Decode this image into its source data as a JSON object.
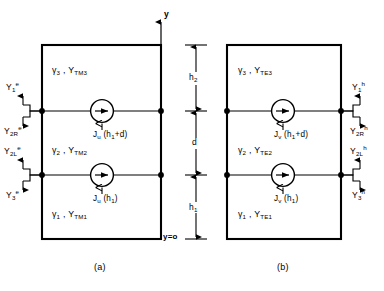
{
  "figure": {
    "background": "#ffffff",
    "line_color": "#000000",
    "panels": [
      {
        "id": "a",
        "caption": "(a)",
        "mode": "TM",
        "media": [
          {
            "region": "top",
            "gamma": "γ",
            "gamma_sub": "3",
            "admittance": "Y",
            "admittance_sub": "TM3"
          },
          {
            "region": "middle",
            "gamma": "γ",
            "gamma_sub": "2",
            "admittance": "Y",
            "admittance_sub": "TM2"
          },
          {
            "region": "bottom",
            "gamma": "γ",
            "gamma_sub": "1",
            "admittance": "Y",
            "admittance_sub": "TM1"
          }
        ],
        "sources": [
          {
            "symbol": "J",
            "symbol_sub": "u",
            "arg": "(h",
            "arg_sub": "1",
            "arg_tail": "+d)"
          },
          {
            "symbol": "J",
            "symbol_sub": "u",
            "arg": "(h",
            "arg_sub": "1",
            "arg_tail": ")"
          }
        ],
        "admittance_labels": [
          {
            "base": "Y",
            "sub": "1",
            "sup": "e",
            "arrow": "up",
            "at_node": "upper"
          },
          {
            "base": "Y",
            "sub": "2R",
            "sup": "e",
            "arrow": "down",
            "at_node": "upper"
          },
          {
            "base": "Y",
            "sub": "2L",
            "sup": "e",
            "arrow": "up",
            "at_node": "lower"
          },
          {
            "base": "Y",
            "sub": "3",
            "sup": "e",
            "arrow": "down",
            "at_node": "lower"
          }
        ],
        "labels_side": "left"
      },
      {
        "id": "b",
        "caption": "(b)",
        "mode": "TE",
        "media": [
          {
            "region": "top",
            "gamma": "γ",
            "gamma_sub": "3",
            "admittance": "Y",
            "admittance_sub": "TE3"
          },
          {
            "region": "middle",
            "gamma": "γ",
            "gamma_sub": "2",
            "admittance": "Y",
            "admittance_sub": "TE2"
          },
          {
            "region": "bottom",
            "gamma": "γ",
            "gamma_sub": "1",
            "admittance": "Y",
            "admittance_sub": "TE1"
          }
        ],
        "sources": [
          {
            "symbol": "J",
            "symbol_sub": "v",
            "arg": "(h",
            "arg_sub": "1",
            "arg_tail": "+d)"
          },
          {
            "symbol": "J",
            "symbol_sub": "v",
            "arg": "(h",
            "arg_sub": "1",
            "arg_tail": ")"
          }
        ],
        "admittance_labels": [
          {
            "base": "Y",
            "sub": "1",
            "sup": "h",
            "arrow": "up",
            "at_node": "upper"
          },
          {
            "base": "Y",
            "sub": "2R",
            "sup": "h",
            "arrow": "down",
            "at_node": "upper"
          },
          {
            "base": "Y",
            "sub": "2L",
            "sup": "h",
            "arrow": "up",
            "at_node": "lower"
          },
          {
            "base": "Y",
            "sub": "3",
            "sup": "h",
            "arrow": "down",
            "at_node": "lower"
          }
        ],
        "labels_side": "right"
      }
    ],
    "axis": {
      "label": "y",
      "origin_label": "y=o"
    },
    "dimensions": [
      {
        "name": "h2",
        "base": "h",
        "sub": "2"
      },
      {
        "name": "d",
        "base": "d",
        "sub": ""
      },
      {
        "name": "h1",
        "base": "h",
        "sub": "1"
      }
    ]
  }
}
